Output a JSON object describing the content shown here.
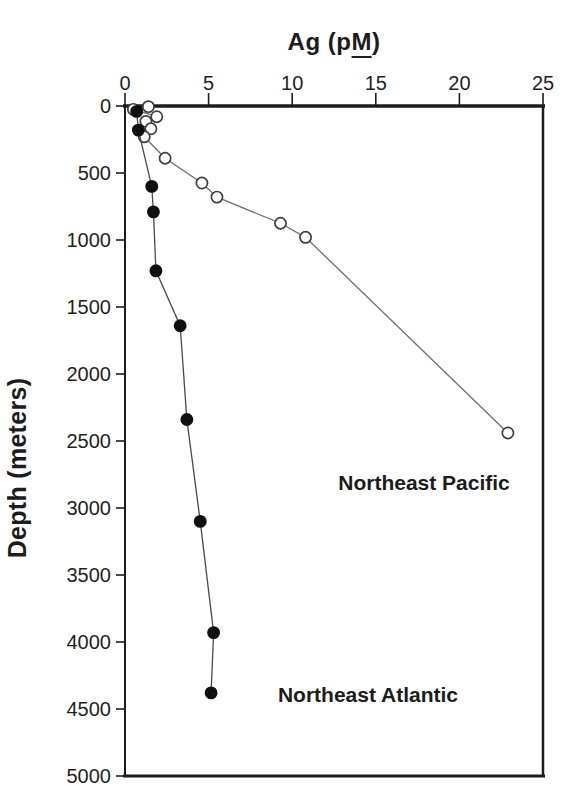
{
  "title": {
    "text": "Ag (pM)",
    "pre": "Ag (p",
    "underline": "M",
    "post": ")"
  },
  "chart_data": {
    "type": "scatter",
    "title": "Ag (pM)",
    "xlabel": "Ag (pM)",
    "ylabel": "Depth (meters)",
    "grid": false,
    "frame_color": "#1c1c1c",
    "background": "#ffffff",
    "x_axis": {
      "position": "top",
      "range": [
        0,
        25
      ],
      "ticks": [
        0,
        5,
        10,
        15,
        20,
        25
      ]
    },
    "y_axis": {
      "inverted": true,
      "range": [
        0,
        5000
      ],
      "ticks": [
        0,
        500,
        1000,
        1500,
        2000,
        2500,
        3000,
        3500,
        4000,
        4500,
        5000
      ]
    },
    "series": [
      {
        "name": "Northeast Pacific",
        "marker": "open-circle",
        "marker_fill": "#ffffff",
        "marker_stroke": "#3f3f3f",
        "line_color": "#6e6e6e",
        "points": [
          {
            "ag_pM": 1.4,
            "depth_m": 5
          },
          {
            "ag_pM": 0.5,
            "depth_m": 25
          },
          {
            "ag_pM": 1.9,
            "depth_m": 80
          },
          {
            "ag_pM": 1.25,
            "depth_m": 115
          },
          {
            "ag_pM": 1.55,
            "depth_m": 170
          },
          {
            "ag_pM": 1.15,
            "depth_m": 230
          },
          {
            "ag_pM": 2.4,
            "depth_m": 390
          },
          {
            "ag_pM": 4.6,
            "depth_m": 575
          },
          {
            "ag_pM": 5.5,
            "depth_m": 680
          },
          {
            "ag_pM": 9.3,
            "depth_m": 875
          },
          {
            "ag_pM": 10.8,
            "depth_m": 980
          },
          {
            "ag_pM": 22.9,
            "depth_m": 2440
          }
        ]
      },
      {
        "name": "Northeast Atlantic",
        "marker": "filled-circle",
        "marker_fill": "#101010",
        "marker_stroke": "#101010",
        "line_color": "#4a4a4a",
        "points": [
          {
            "ag_pM": 0.7,
            "depth_m": 40
          },
          {
            "ag_pM": 0.8,
            "depth_m": 180
          },
          {
            "ag_pM": 1.6,
            "depth_m": 600
          },
          {
            "ag_pM": 1.7,
            "depth_m": 790
          },
          {
            "ag_pM": 1.85,
            "depth_m": 1230
          },
          {
            "ag_pM": 3.3,
            "depth_m": 1640
          },
          {
            "ag_pM": 3.7,
            "depth_m": 2340
          },
          {
            "ag_pM": 4.5,
            "depth_m": 3100
          },
          {
            "ag_pM": 5.3,
            "depth_m": 3930
          },
          {
            "ag_pM": 5.15,
            "depth_m": 4380
          }
        ]
      }
    ],
    "annotations": [
      {
        "text": "Northeast Pacific"
      },
      {
        "text": "Northeast Atlantic"
      }
    ]
  }
}
